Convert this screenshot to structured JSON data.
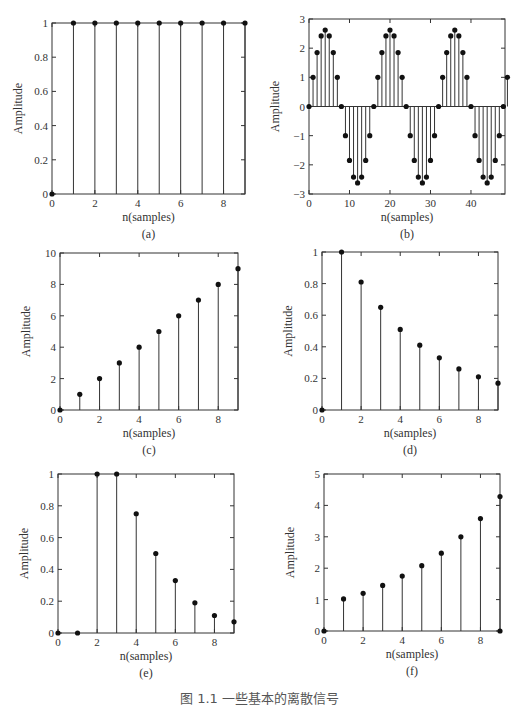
{
  "figure_caption": "图 1.1  一些基本的离散信号",
  "chart_data": [
    {
      "id": "a",
      "type": "stem",
      "panel_label": "(a)",
      "title": "",
      "xlabel": "n(samples)",
      "ylabel": "Amplitude",
      "x": [
        0,
        1,
        2,
        3,
        4,
        5,
        6,
        7,
        8,
        9
      ],
      "values": [
        0,
        1,
        1,
        1,
        1,
        1,
        1,
        1,
        1,
        1
      ],
      "xlim": [
        0,
        9
      ],
      "ylim": [
        0,
        1
      ],
      "xticks": [
        0,
        2,
        4,
        6,
        8
      ],
      "yticks": [
        0,
        0.2,
        0.4,
        0.6,
        0.8,
        1
      ],
      "ytick_labels": [
        "0",
        "0.2",
        "0.4",
        "0.6",
        "0.8",
        "1"
      ],
      "box": [
        52,
        23,
        245,
        194
      ]
    },
    {
      "id": "b",
      "type": "stem",
      "panel_label": "(b)",
      "title": "",
      "xlabel": "n(samples)",
      "ylabel": "Amplitude",
      "x": [
        0,
        1,
        2,
        3,
        4,
        5,
        6,
        7,
        8,
        9,
        10,
        11,
        12,
        13,
        14,
        15,
        16,
        17,
        18,
        19,
        20,
        21,
        22,
        23,
        24,
        25,
        26,
        27,
        28,
        29,
        30,
        31,
        32,
        33,
        34,
        35,
        36,
        37,
        38,
        39,
        40,
        41,
        42,
        43,
        44,
        45,
        46,
        47,
        48,
        49
      ],
      "values": [
        0,
        1,
        1.85,
        2.42,
        2.62,
        2.42,
        1.85,
        1,
        0,
        -1,
        -1.85,
        -2.42,
        -2.62,
        -2.42,
        -1.85,
        -1,
        0,
        1,
        1.85,
        2.42,
        2.62,
        2.42,
        1.85,
        1,
        0,
        -1,
        -1.85,
        -2.42,
        -2.62,
        -2.42,
        -1.85,
        -1,
        0,
        1,
        1.85,
        2.42,
        2.62,
        2.42,
        1.85,
        1,
        0,
        -1,
        -1.85,
        -2.42,
        -2.62,
        -2.42,
        -1.85,
        -1,
        0,
        1
      ],
      "xlim": [
        0,
        48.4
      ],
      "ylim": [
        -3,
        3
      ],
      "xticks": [
        0,
        10,
        20,
        30,
        40
      ],
      "yticks": [
        -3,
        -2,
        -1,
        0,
        1,
        2,
        3
      ],
      "ytick_labels": [
        "−3",
        "−2",
        "−1",
        "0",
        "1",
        "2",
        "3"
      ],
      "box": [
        309,
        19,
        505,
        194
      ]
    },
    {
      "id": "c",
      "type": "stem",
      "panel_label": "(c)",
      "title": "",
      "xlabel": "n(samples)",
      "ylabel": "Amplitude",
      "x": [
        0,
        1,
        2,
        3,
        4,
        5,
        6,
        7,
        8,
        9
      ],
      "values": [
        0,
        1,
        2,
        3,
        4,
        5,
        6,
        7,
        8,
        9
      ],
      "xlim": [
        0,
        9
      ],
      "ylim": [
        0,
        10
      ],
      "xticks": [
        0,
        2,
        4,
        6,
        8
      ],
      "yticks": [
        0,
        2,
        4,
        6,
        8,
        10
      ],
      "ytick_labels": [
        "0",
        "2",
        "4",
        "6",
        "8",
        "10"
      ],
      "box": [
        60,
        253,
        238,
        410
      ]
    },
    {
      "id": "d",
      "type": "stem",
      "panel_label": "(d)",
      "title": "",
      "xlabel": "n(samples)",
      "ylabel": "Amplitude",
      "x": [
        0,
        1,
        2,
        3,
        4,
        5,
        6,
        7,
        8,
        9
      ],
      "values": [
        0,
        1,
        0.81,
        0.65,
        0.51,
        0.41,
        0.33,
        0.26,
        0.21,
        0.17
      ],
      "xlim": [
        0,
        9
      ],
      "ylim": [
        0,
        1
      ],
      "xticks": [
        0,
        2,
        4,
        6,
        8
      ],
      "yticks": [
        0,
        0.2,
        0.4,
        0.6,
        0.8,
        1
      ],
      "ytick_labels": [
        "0",
        "0.2",
        "0.4",
        "0.6",
        "0.8",
        "1"
      ],
      "box": [
        322,
        252,
        498,
        410
      ]
    },
    {
      "id": "e",
      "type": "stem",
      "panel_label": "(e)",
      "title": "",
      "xlabel": "n(samples)",
      "ylabel": "Amplitude",
      "x": [
        0,
        1,
        2,
        3,
        4,
        5,
        6,
        7,
        8,
        9
      ],
      "values": [
        0,
        0,
        1,
        1,
        0.75,
        0.5,
        0.33,
        0.19,
        0.11,
        0.07
      ],
      "xlim": [
        0,
        9
      ],
      "ylim": [
        0,
        1
      ],
      "xticks": [
        0,
        2,
        4,
        6,
        8
      ],
      "yticks": [
        0,
        0.2,
        0.4,
        0.6,
        0.8,
        1
      ],
      "ytick_labels": [
        "0",
        "0.2",
        "0.4",
        "0.6",
        "0.8",
        "1"
      ],
      "box": [
        58,
        474,
        234,
        633
      ]
    },
    {
      "id": "f",
      "type": "stem",
      "panel_label": "(f)",
      "title": "",
      "xlabel": "n(samples)",
      "ylabel": "Amplitude",
      "x": [
        0,
        1,
        2,
        3,
        4,
        5,
        6,
        7,
        8,
        9,
        9
      ],
      "values": [
        0,
        1.02,
        1.2,
        1.45,
        1.75,
        2.08,
        2.48,
        3.0,
        3.58,
        4.28,
        0
      ],
      "xlim": [
        0,
        9
      ],
      "ylim": [
        0,
        5
      ],
      "xticks": [
        0,
        2,
        4,
        6,
        8
      ],
      "yticks": [
        0,
        1,
        2,
        3,
        4,
        5
      ],
      "ytick_labels": [
        "0",
        "1",
        "2",
        "3",
        "4",
        "5"
      ],
      "box": [
        324,
        474,
        500,
        631
      ]
    }
  ]
}
